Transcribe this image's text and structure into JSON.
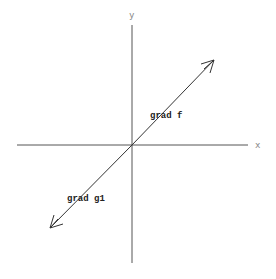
{
  "diagram": {
    "axes": {
      "x_label": "x",
      "y_label": "y"
    },
    "vectors": [
      {
        "label": "grad f",
        "direction": "up-right"
      },
      {
        "label": "grad g1",
        "direction": "down-left"
      }
    ],
    "colors": {
      "axis": "#555555",
      "vector": "#333333",
      "axis_label": "#888888",
      "vector_label": "#222222"
    }
  }
}
